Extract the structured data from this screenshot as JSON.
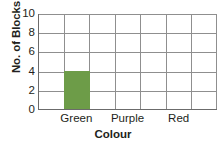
{
  "chart_data": {
    "type": "bar",
    "title": "",
    "xlabel": "Colour",
    "ylabel": "No. of Blocks",
    "categories": [
      "Green",
      "Purple",
      "Red"
    ],
    "values": [
      4,
      0,
      0
    ],
    "series": [
      {
        "name": "No. of Blocks",
        "values": [
          4,
          0,
          0
        ],
        "color": "#6d9c48"
      }
    ],
    "ylim": [
      0,
      10
    ],
    "y_ticks": [
      0,
      2,
      4,
      6,
      8,
      10
    ],
    "y_tick_labels": [
      "0",
      "2",
      "4",
      "6",
      "8",
      "10"
    ],
    "grid": true,
    "grid_columns": 7,
    "grid_rows": 5,
    "grid_color": "#8f8f8f",
    "axis_color": "#6b6b6b",
    "background_color": "#ffffff",
    "legend": "none",
    "bar_category_slots": [
      "",
      "Green",
      "",
      "Purple",
      "",
      "Red",
      ""
    ],
    "bar_slot_index": 1,
    "annotations": []
  }
}
